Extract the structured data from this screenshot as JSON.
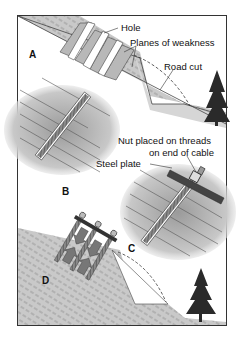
{
  "figure": {
    "labels": {
      "hole": "Hole",
      "planes_of_weakness": "Planes of weakness",
      "road_cut": "Road cut",
      "nut_line1": "Nut placed on threads",
      "nut_line2": "on end of cable",
      "steel_plate": "Steel plate"
    },
    "panels": {
      "a": "A",
      "b": "B",
      "c": "C",
      "d": "D"
    }
  },
  "colors": {
    "frame": "#333333",
    "rock_fill": "#bdbdbd",
    "rock_line": "#555555",
    "bolt": "#6e6e6e",
    "tree": "#2a2a2a"
  }
}
